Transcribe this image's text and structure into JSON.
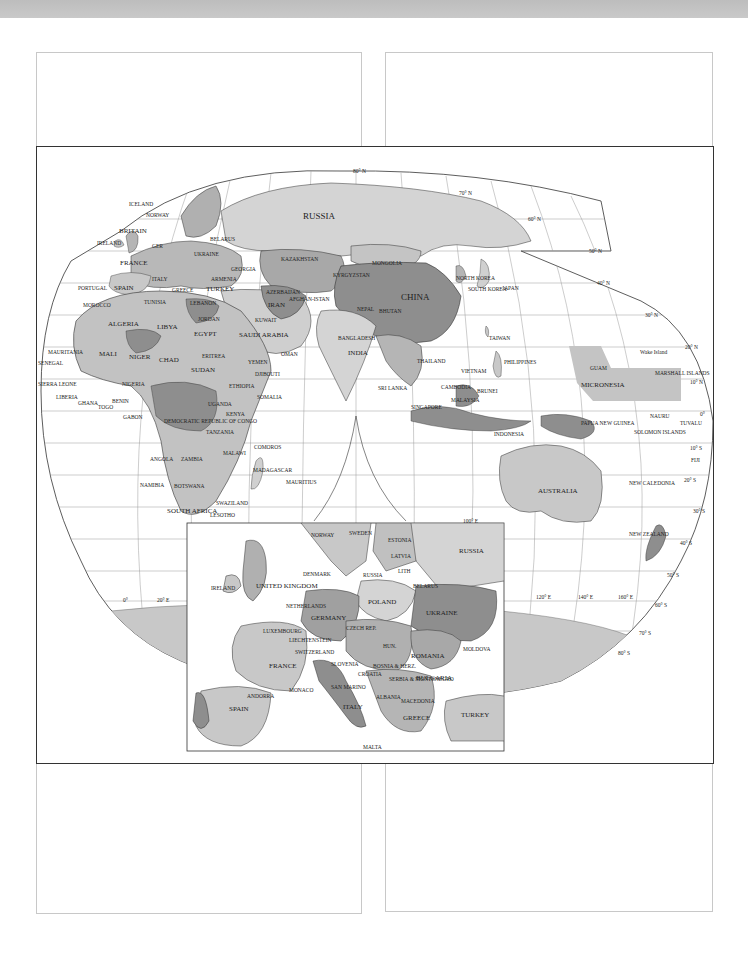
{
  "page": {
    "panels": [
      {
        "id": "top-left",
        "x": 36,
        "y": 52,
        "w": 324,
        "h": 94
      },
      {
        "id": "top-right",
        "x": 385,
        "y": 52,
        "w": 326,
        "h": 94
      },
      {
        "id": "bottom-left",
        "x": 36,
        "y": 762,
        "w": 324,
        "h": 150
      },
      {
        "id": "bottom-right",
        "x": 385,
        "y": 762,
        "w": 326,
        "h": 148
      }
    ]
  },
  "map": {
    "title": "",
    "colors": {
      "land_light": "#d4d4d4",
      "land_mid": "#b5b5b5",
      "land_dark": "#8e8e8e",
      "ocean": "#ffffff",
      "border": "#333333",
      "graticule": "#9a9a9a"
    },
    "graticule_labels": {
      "lat_80n": "80° N",
      "lat_70n": "70° N",
      "lat_60n": "60° N",
      "lat_50n": "50° N",
      "lat_40n": "40° N",
      "lat_30n": "30° N",
      "lat_20n": "20° N",
      "lat_10n": "10° N",
      "lat_0": "0°",
      "lat_10s": "10° S",
      "lat_20s": "20° S",
      "lat_30s": "30° S",
      "lat_40s": "40° S",
      "lat_50s": "50° S",
      "lat_60s": "60° S",
      "lat_70s": "70° S",
      "lat_80s": "80° S",
      "lon_0": "0°",
      "lon_20e": "20° E",
      "lon_100e": "100° E",
      "lon_120e": "120° E",
      "lon_140e": "140° E",
      "lon_160e": "160° E"
    },
    "labels": {
      "russia": "RUSSIA",
      "iceland": "ICELAND",
      "norway": "NORWAY",
      "sweden": "SWEDEN",
      "finland": "FINLAND",
      "britain": "BRITAIN",
      "ireland": "IRELAND",
      "germany_abbr": "GER",
      "belarus": "BELARUS",
      "ukraine": "UKRAINE",
      "france": "FRANCE",
      "portugal": "PORTUGAL",
      "spain": "SPAIN",
      "italy": "ITALY",
      "greece": "GREECE",
      "romania_abbr": "ROM",
      "bulgaria_abbr": "BUL",
      "georgia": "GEORGIA",
      "armenia": "ARMENIA",
      "turkey": "TURKEY",
      "kazakhstan": "KAZAKHSTAN",
      "uzbekistan": "UZBEKISTAN",
      "turkmenistan": "TURKMENISTAN",
      "kyrgyzstan": "KYRGYZSTAN",
      "tajikistan": "TAJIKISTAN",
      "mongolia": "MONGOLIA",
      "china": "CHINA",
      "north_korea": "NORTH KOREA",
      "south_korea": "SOUTH KOREA",
      "japan": "JAPAN",
      "morocco": "MOROCCO",
      "tunisia": "TUNISIA",
      "lebanon": "LEBANON",
      "syria": "SYRIA",
      "iraq": "IRAQ",
      "israel": "ISRAEL",
      "jordan": "JORDAN",
      "azerbaijan": "AZERBAIJAN",
      "iran": "IRAN",
      "afghanistan": "AFGHAN-ISTAN",
      "pakistan": "PAKISTAN",
      "kuwait": "KUWAIT",
      "nepal": "NEPAL",
      "bhutan": "BHUTAN",
      "bangladesh": "BANGLADESH",
      "india": "INDIA",
      "myanmar": "MYANMAR",
      "taiwan": "TAIWAN",
      "western_sahara": "WESTERN SAHARA",
      "algeria": "ALGERIA",
      "libya": "LIBYA",
      "egypt": "EGYPT",
      "saudi_arabia": "SAUDI ARABIA",
      "oman": "OMAN",
      "yemen": "YEMEN",
      "djibouti": "DJIBOUTI",
      "mauritania": "MAURITANIA",
      "mali": "MALI",
      "niger": "NIGER",
      "chad": "CHAD",
      "eritrea": "ERITREA",
      "sudan": "SUDAN",
      "senegal": "SENEGAL",
      "guinea": "GUINEA",
      "sierra_leone": "SIERRA LEONE",
      "liberia": "LIBERIA",
      "ivory_coast": "IVORY COAST",
      "ghana": "GHANA",
      "togo": "TOGO",
      "benin": "BENIN",
      "nigeria": "NIGERIA",
      "cameroon": "CAMEROON",
      "car": "CENTRAL AFRICAN REP.",
      "ethiopia": "ETHIOPIA",
      "somalia": "SOMALIA",
      "gabon": "GABON",
      "drc": "DEMOCRATIC REPUBLIC OF CONGO",
      "uganda": "UGANDA",
      "kenya": "KENYA",
      "tanzania": "TANZANIA",
      "comoros": "COMOROS",
      "angola": "ANGOLA",
      "zambia": "ZAMBIA",
      "malawi": "MALAWI",
      "zimbabwe": "ZIMBABWE",
      "mozambique": "MOZAMBIQUE",
      "madagascar": "MADAGASCAR",
      "mauritius": "MAURITIUS",
      "namibia": "NAMIBIA",
      "botswana": "BOTSWANA",
      "swaziland": "SWAZILAND",
      "south_africa": "SOUTH AFRICA",
      "lesotho": "LESOTHO",
      "sri_lanka": "SRI LANKA",
      "thailand": "THAILAND",
      "vietnam": "VIETNAM",
      "cambodia": "CAMBODIA",
      "philippines": "PHILIPPINES",
      "brunei": "BRUNEI",
      "malaysia": "MALAYSIA",
      "singapore": "SINGAPORE",
      "indonesia": "INDONESIA",
      "papua_new_guinea": "PAPUA NEW GUINEA",
      "guam": "GUAM",
      "micronesia": "MICRONESIA",
      "wake_island": "Wake Island",
      "marshall_islands": "MARSHALL ISLANDS",
      "nauru": "NAURU",
      "tuvalu": "TUVALU",
      "solomon_islands": "SOLOMON ISLANDS",
      "fiji": "FIJI",
      "new_caledonia": "NEW CALEDONIA",
      "australia": "AUSTRALIA",
      "new_zealand": "NEW ZEALAND"
    },
    "inset": {
      "name": "Europe inset",
      "labels": {
        "norway": "NORWAY",
        "sweden": "SWEDEN",
        "estonia": "ESTONIA",
        "latvia": "LATVIA",
        "lithuania": "LITH",
        "russia": "RUSSIA",
        "russia_kaliningrad": "RUSSIA",
        "denmark": "DENMARK",
        "ireland": "IRELAND",
        "united_kingdom": "UNITED KINGDOM",
        "belarus": "BELARUS",
        "poland": "POLAND",
        "netherlands": "NETHERLANDS",
        "belgium": "BELG.",
        "germany": "GERMANY",
        "ukraine": "UKRAINE",
        "luxembourg": "LUXEMBOURG",
        "czech_rep": "CZECH REP.",
        "slovakia": "SLOVAKIA",
        "liechtenstein": "LIECHTENSTEIN",
        "austria": "AUSTRIA",
        "hungary": "HUN.",
        "moldova": "MOLDOVA",
        "switzerland": "SWITZERLAND",
        "romania": "ROMANIA",
        "france": "FRANCE",
        "slovenia": "SLOVENIA",
        "croatia": "CROATIA",
        "bosnia": "BOSNIA & HERZ.",
        "serbia": "SERBIA & MONTENEGRO",
        "bulgaria": "BULGARIA",
        "monaco": "MONACO",
        "san_marino": "SAN MARINO",
        "andorra": "ANDORRA",
        "portugal": "PORTUGAL",
        "spain": "SPAIN",
        "italy": "ITALY",
        "albania": "ALBANIA",
        "macedonia": "MACEDONIA",
        "greece": "GREECE",
        "turkey": "TURKEY",
        "malta": "MALTA"
      }
    }
  }
}
